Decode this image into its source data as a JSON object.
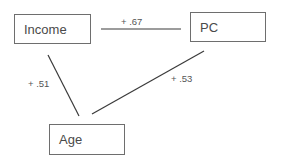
{
  "diagram": {
    "nodes": [
      {
        "id": "income",
        "label": "Income"
      },
      {
        "id": "pc",
        "label": "PC"
      },
      {
        "id": "age",
        "label": "Age"
      }
    ],
    "edges": [
      {
        "from": "income",
        "to": "pc",
        "label": "+ .67"
      },
      {
        "from": "income",
        "to": "age",
        "label": "+ .51"
      },
      {
        "from": "pc",
        "to": "age",
        "label": "+ .53"
      }
    ],
    "colors": {
      "line": "#3a3a3a",
      "box_border": "#6e6e6e",
      "text": "#4a4a4a"
    }
  }
}
